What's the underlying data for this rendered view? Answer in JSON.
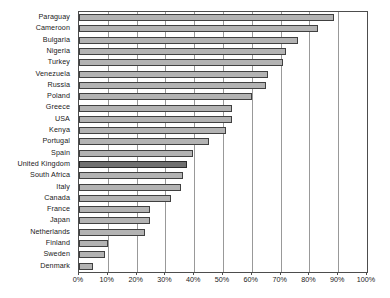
{
  "chart_data": {
    "type": "bar",
    "orientation": "horizontal",
    "title": "",
    "subtitle": "",
    "xlabel": "",
    "ylabel": "",
    "xlim": [
      0,
      100
    ],
    "grid": true,
    "legend": false,
    "legend_position": "none",
    "highlight_category": "United Kingdom",
    "colors": {
      "bar_fill": "#b3b3b3",
      "bar_border": "#404040",
      "highlight_fill": "#707070",
      "highlight_border": "#2b2b2b",
      "gridline": "#999999",
      "axis": "#4d4d4d",
      "text": "#1a1a1a",
      "background": "#ffffff"
    },
    "xtick_labels": [
      "0%",
      "10%",
      "20%",
      "30%",
      "40%",
      "50%",
      "60%",
      "70%",
      "80%",
      "90%",
      "100%"
    ],
    "xticks": [
      0,
      10,
      20,
      30,
      40,
      50,
      60,
      70,
      80,
      90,
      100
    ],
    "categories": [
      "Paraguay",
      "Cameroon",
      "Bulgaria",
      "Nigeria",
      "Turkey",
      "Venezuela",
      "Russia",
      "Poland",
      "Greece",
      "USA",
      "Kenya",
      "Portugal",
      "Spain",
      "United Kingdom",
      "South Africa",
      "Italy",
      "Canada",
      "France",
      "Japan",
      "Netherlands",
      "Finland",
      "Sweden",
      "Denmark"
    ],
    "values": [
      88.5,
      83.0,
      76.0,
      72.0,
      71.0,
      65.5,
      65.0,
      60.0,
      53.0,
      53.0,
      51.0,
      45.0,
      39.5,
      37.5,
      36.0,
      35.5,
      32.0,
      24.5,
      24.5,
      23.0,
      10.0,
      9.0,
      5.0
    ]
  }
}
